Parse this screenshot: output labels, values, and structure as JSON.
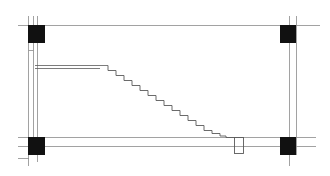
{
  "drawing": {
    "type": "architectural-plan",
    "subject": "staircase between columns",
    "colors": {
      "background": "#ffffff",
      "line": "#8a8a8a",
      "stair_line": "#5a5a5a",
      "column_fill": "#111111"
    },
    "columns": [
      {
        "name": "top-left",
        "x": 28,
        "y": 25,
        "w": 17,
        "h": 18
      },
      {
        "name": "top-right",
        "x": 280,
        "y": 25,
        "w": 16,
        "h": 18
      },
      {
        "name": "bottom-left",
        "x": 28,
        "y": 137,
        "w": 17,
        "h": 18
      },
      {
        "name": "bottom-right",
        "x": 280,
        "y": 137,
        "w": 16,
        "h": 18
      }
    ],
    "stair": {
      "landing_y": 66,
      "landing_x_start": 35,
      "landing_x_end": 108,
      "step_count": 16,
      "end_x": 234,
      "end_y": 137,
      "newel": {
        "x": 234,
        "y": 137,
        "w": 9,
        "h": 17
      }
    }
  }
}
